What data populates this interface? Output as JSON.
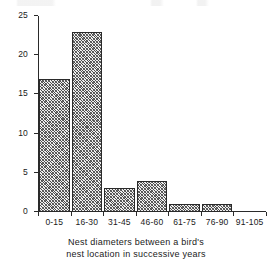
{
  "chart_data": {
    "type": "bar",
    "title": "",
    "categories": [
      "0-15",
      "16-30",
      "31-45",
      "46-60",
      "61-75",
      "76-90",
      "91-105"
    ],
    "values": [
      17,
      23,
      3,
      4,
      1,
      1,
      0
    ],
    "xlabel": "Nest diameters between a bird's nest location in successive years",
    "xlabel_line1": "Nest diameters between a bird's",
    "xlabel_line2": "nest location in successive years",
    "ylabel": "Observed instances",
    "ylim": [
      0,
      25
    ],
    "yticks": [
      0,
      5,
      10,
      15,
      20,
      25
    ],
    "ytick_labels": [
      "0",
      "5",
      "10",
      "15",
      "20",
      "25"
    ],
    "grid": false,
    "legend": null,
    "bar_fill": "#8a8a8a",
    "bar_edge": "#2a2a2a",
    "background": "#ffffff"
  }
}
